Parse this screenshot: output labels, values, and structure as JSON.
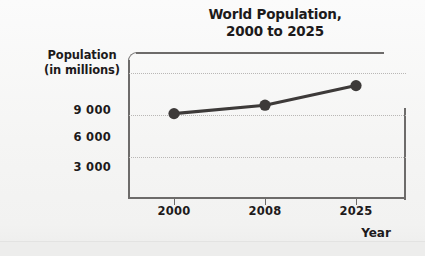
{
  "chart_data": {
    "type": "line",
    "title": "World Population, 2000 to 2025",
    "title_lines": [
      "World Population,",
      "2000 to 2025"
    ],
    "xlabel": "Year",
    "ylabel": "Population (in millions)",
    "ylabel_lines": [
      "Population",
      "(in millions)"
    ],
    "categories": [
      "2000",
      "2008",
      "2025"
    ],
    "x": [
      2000,
      2008,
      2025
    ],
    "values": [
      6100,
      6700,
      8100
    ],
    "series": [
      {
        "name": "World Population",
        "values": [
          6100,
          6700,
          8100
        ]
      }
    ],
    "ytick_labels": [
      "9 000",
      "6 000",
      "3 000"
    ],
    "ytick_values": [
      9000,
      6000,
      3000
    ],
    "ylim": [
      0,
      10500
    ],
    "xtick_labels": [
      "2000",
      "2008",
      "2025"
    ],
    "grid": "horizontal-dotted",
    "legend": "none",
    "colors": {
      "line": "#3d3a39",
      "marker": "#3d3a39",
      "axis": "#6d6b6a",
      "gridline": "#b9b7b5",
      "text": "#1d1a1b",
      "background": "#f6f6f5",
      "plot_background": "#ffffff"
    }
  }
}
